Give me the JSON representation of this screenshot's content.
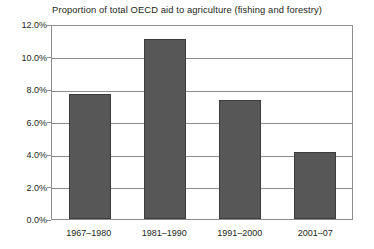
{
  "chart_data": {
    "type": "bar",
    "title": "Proportion of total OECD aid to agriculture (fishing and forestry)",
    "xlabel": "",
    "ylabel": "",
    "categories": [
      "1967–1980",
      "1981–1990",
      "1991–2000",
      "2001–07"
    ],
    "values": [
      7.7,
      11.1,
      7.3,
      4.1
    ],
    "value_format": "percent",
    "ylim": [
      0,
      12
    ],
    "ytick_values": [
      0,
      2,
      4,
      6,
      8,
      10,
      12
    ],
    "ytick_labels": [
      "0.0%",
      "2.0%",
      "4.0%",
      "6.0%",
      "8.0%",
      "10.0%",
      "12.0%"
    ],
    "grid": true,
    "legend": null,
    "colors": {
      "bar_fill": "#575757",
      "bar_border": "#3c3c3c",
      "grid": "#8d8d8d",
      "axis": "#8d8d8d",
      "text": "#231f20",
      "background": "#ffffff"
    }
  }
}
